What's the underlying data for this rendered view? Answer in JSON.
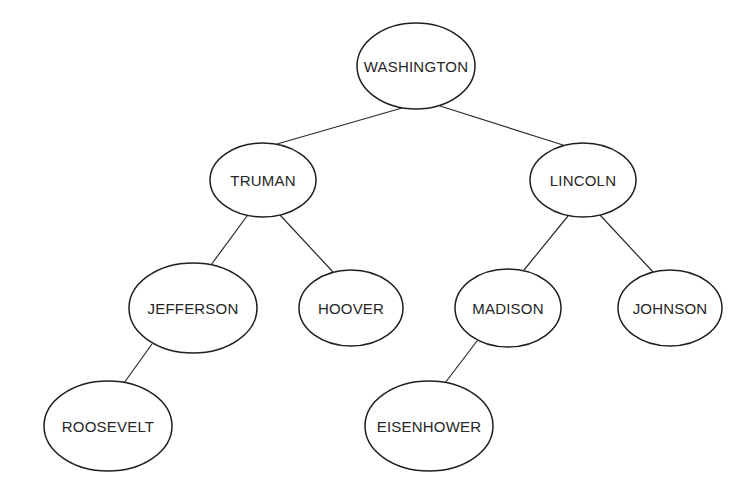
{
  "diagram": {
    "type": "binary-tree",
    "root": "WASHINGTON",
    "colors": {
      "background": "#ffffff",
      "stroke": "#1f1f1f",
      "text": "#262626"
    },
    "nodes": [
      {
        "id": "washington",
        "label": "WASHINGTON",
        "cx": 416,
        "cy": 66,
        "rx": 59,
        "ry": 43
      },
      {
        "id": "truman",
        "label": "TRUMAN",
        "cx": 263,
        "cy": 180,
        "rx": 53,
        "ry": 37
      },
      {
        "id": "lincoln",
        "label": "LINCOLN",
        "cx": 583,
        "cy": 180,
        "rx": 53,
        "ry": 37
      },
      {
        "id": "jefferson",
        "label": "JEFFERSON",
        "cx": 193,
        "cy": 308,
        "rx": 64,
        "ry": 45
      },
      {
        "id": "hoover",
        "label": "HOOVER",
        "cx": 351,
        "cy": 308,
        "rx": 52,
        "ry": 38
      },
      {
        "id": "madison",
        "label": "MADISON",
        "cx": 508,
        "cy": 308,
        "rx": 53,
        "ry": 39
      },
      {
        "id": "johnson",
        "label": "JOHNSON",
        "cx": 670,
        "cy": 308,
        "rx": 52,
        "ry": 38
      },
      {
        "id": "roosevelt",
        "label": "ROOSEVELT",
        "cx": 108,
        "cy": 426,
        "rx": 64,
        "ry": 45
      },
      {
        "id": "eisenhower",
        "label": "EISENHOWER",
        "cx": 429,
        "cy": 426,
        "rx": 64,
        "ry": 45
      }
    ],
    "edges": [
      {
        "from": "washington",
        "to": "truman",
        "x1": 402,
        "y1": 108,
        "x2": 277,
        "y2": 144
      },
      {
        "from": "washington",
        "to": "lincoln",
        "x1": 440,
        "y1": 106,
        "x2": 563,
        "y2": 145
      },
      {
        "from": "truman",
        "to": "jefferson",
        "x1": 247,
        "y1": 216,
        "x2": 211,
        "y2": 265
      },
      {
        "from": "truman",
        "to": "hoover",
        "x1": 280,
        "y1": 215,
        "x2": 333,
        "y2": 272
      },
      {
        "from": "lincoln",
        "to": "madison",
        "x1": 568,
        "y1": 216,
        "x2": 524,
        "y2": 270
      },
      {
        "from": "lincoln",
        "to": "johnson",
        "x1": 600,
        "y1": 215,
        "x2": 653,
        "y2": 272
      },
      {
        "from": "jefferson",
        "to": "roosevelt",
        "x1": 152,
        "y1": 344,
        "x2": 124,
        "y2": 383
      },
      {
        "from": "madison",
        "to": "eisenhower",
        "x1": 477,
        "y1": 341,
        "x2": 445,
        "y2": 383
      }
    ]
  }
}
